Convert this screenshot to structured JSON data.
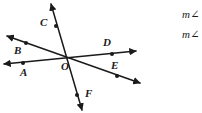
{
  "figure": {
    "type": "geometry-diagram",
    "background_color": "#ffffff",
    "stroke_color": "#1a1a1a",
    "vertex": {
      "name": "O",
      "x": 68,
      "y": 57
    },
    "lines": [
      {
        "name": "line-CF",
        "ray_a": "C",
        "ray_b": "F"
      },
      {
        "name": "line-BE",
        "ray_a": "B",
        "ray_b": "E"
      },
      {
        "name": "line-AD",
        "ray_a": "A",
        "ray_b": "D"
      }
    ],
    "rays": [
      {
        "label": "C",
        "dot_x": 56,
        "dot_y": 26,
        "tip_x": 51,
        "tip_y": 4,
        "label_x": 40,
        "label_y": 17
      },
      {
        "label": "B",
        "dot_x": 26,
        "dot_y": 43,
        "tip_x": 7,
        "tip_y": 36,
        "label_x": 14,
        "label_y": 45
      },
      {
        "label": "A",
        "dot_x": 23,
        "dot_y": 63,
        "tip_x": 4,
        "tip_y": 64,
        "label_x": 20,
        "label_y": 67
      },
      {
        "label": "D",
        "dot_x": 112,
        "dot_y": 54,
        "tip_x": 136,
        "tip_y": 51,
        "label_x": 103,
        "label_y": 37
      },
      {
        "label": "E",
        "dot_x": 117,
        "dot_y": 76,
        "tip_x": 140,
        "tip_y": 83,
        "label_x": 111,
        "label_y": 60
      },
      {
        "label": "F",
        "dot_x": 77,
        "dot_y": 95,
        "tip_x": 82,
        "tip_y": 110,
        "label_x": 85,
        "label_y": 88
      }
    ],
    "vertex_label": {
      "text": "O",
      "x": 61,
      "y": 61
    }
  },
  "equations": {
    "line1": "m∠",
    "line2": "m∠"
  }
}
